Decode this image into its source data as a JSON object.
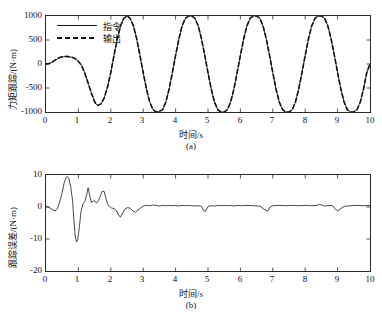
{
  "page": {
    "top_clipped_text": "",
    "bottom_caption_clipped": ""
  },
  "chart_data": [
    {
      "id": "panel-a",
      "type": "line",
      "title": "",
      "sublabel": "(a)",
      "xlabel": "时间/s",
      "ylabel": "力矩跟踪/(N·m)",
      "xlim": [
        0,
        10
      ],
      "ylim": [
        -1000,
        1000
      ],
      "xticks": [
        0,
        1,
        2,
        3,
        4,
        5,
        6,
        7,
        8,
        9,
        10
      ],
      "xticklabels": [
        "0",
        "1",
        "2",
        "3",
        "4",
        "5",
        "6",
        "7",
        "8",
        "9",
        "10"
      ],
      "yticks": [
        -1000,
        -500,
        0,
        500,
        1000
      ],
      "yticklabels": [
        "-1000",
        "-500",
        "0",
        "500",
        "1000"
      ],
      "grid": false,
      "legend_position": "upper-left-inside",
      "series": [
        {
          "name": "指令",
          "style": "solid",
          "color": "#1a1a1a",
          "x": [
            0.0,
            0.1,
            0.2,
            0.3,
            0.4,
            0.5,
            0.6,
            0.7,
            0.8,
            0.9,
            1.0,
            1.1,
            1.2,
            1.3,
            1.4,
            1.5,
            1.55,
            1.6,
            1.7,
            1.8,
            1.9,
            2.0,
            2.1,
            2.2,
            2.3,
            2.4,
            2.5,
            2.6,
            2.7,
            2.8,
            2.9,
            3.0,
            3.1,
            3.2,
            3.3,
            3.4,
            3.5,
            3.6,
            3.7,
            3.8,
            3.9,
            4.0,
            4.1,
            4.2,
            4.3,
            4.4,
            4.5,
            4.6,
            4.7,
            4.8,
            4.9,
            5.0,
            5.1,
            5.2,
            5.3,
            5.4,
            5.5,
            5.6,
            5.7,
            5.8,
            5.9,
            6.0,
            6.1,
            6.2,
            6.3,
            6.4,
            6.5,
            6.6,
            6.7,
            6.8,
            6.9,
            7.0,
            7.1,
            7.2,
            7.3,
            7.4,
            7.5,
            7.6,
            7.7,
            7.8,
            7.9,
            8.0,
            8.1,
            8.2,
            8.3,
            8.4,
            8.5,
            8.6,
            8.7,
            8.8,
            8.9,
            9.0,
            9.1,
            9.2,
            9.3,
            9.4,
            9.5,
            9.6,
            9.7,
            9.8,
            9.9,
            10.0
          ],
          "y": [
            0,
            10,
            40,
            85,
            125,
            148,
            155,
            152,
            140,
            112,
            60,
            -30,
            -190,
            -390,
            -600,
            -780,
            -840,
            -860,
            -830,
            -700,
            -480,
            -180,
            180,
            520,
            790,
            950,
            1000,
            950,
            790,
            520,
            180,
            -180,
            -520,
            -790,
            -950,
            -1000,
            -985,
            -950,
            -790,
            -520,
            -180,
            180,
            520,
            790,
            950,
            1000,
            1000,
            950,
            790,
            520,
            180,
            -180,
            -520,
            -790,
            -950,
            -1000,
            -1000,
            -950,
            -790,
            -520,
            -180,
            180,
            520,
            790,
            950,
            1000,
            1000,
            950,
            790,
            520,
            180,
            -180,
            -520,
            -790,
            -950,
            -1000,
            -1000,
            -950,
            -790,
            -520,
            -180,
            180,
            520,
            790,
            950,
            1000,
            1000,
            950,
            790,
            520,
            180,
            -180,
            -520,
            -790,
            -950,
            -1000,
            -1000,
            -950,
            -790,
            -520,
            -180,
            0
          ]
        },
        {
          "name": "输出",
          "style": "dashed",
          "color": "#111111",
          "x": [
            0.0,
            0.1,
            0.2,
            0.3,
            0.4,
            0.5,
            0.6,
            0.7,
            0.8,
            0.9,
            1.0,
            1.1,
            1.2,
            1.3,
            1.4,
            1.5,
            1.55,
            1.6,
            1.7,
            1.8,
            1.9,
            2.0,
            2.1,
            2.2,
            2.3,
            2.4,
            2.5,
            2.6,
            2.7,
            2.8,
            2.9,
            3.0,
            3.1,
            3.2,
            3.3,
            3.4,
            3.5,
            3.6,
            3.7,
            3.8,
            3.9,
            4.0,
            4.1,
            4.2,
            4.3,
            4.4,
            4.5,
            4.6,
            4.7,
            4.8,
            4.9,
            5.0,
            5.1,
            5.2,
            5.3,
            5.4,
            5.5,
            5.6,
            5.7,
            5.8,
            5.9,
            6.0,
            6.1,
            6.2,
            6.3,
            6.4,
            6.5,
            6.6,
            6.7,
            6.8,
            6.9,
            7.0,
            7.1,
            7.2,
            7.3,
            7.4,
            7.5,
            7.6,
            7.7,
            7.8,
            7.9,
            8.0,
            8.1,
            8.2,
            8.3,
            8.4,
            8.5,
            8.6,
            8.7,
            8.8,
            8.9,
            9.0,
            9.1,
            9.2,
            9.3,
            9.4,
            9.5,
            9.6,
            9.7,
            9.8,
            9.9,
            10.0
          ],
          "y": [
            0,
            12,
            44,
            90,
            130,
            152,
            158,
            154,
            141,
            110,
            56,
            -36,
            -196,
            -396,
            -606,
            -784,
            -844,
            -862,
            -831,
            -698,
            -476,
            -176,
            184,
            524,
            793,
            952,
            1001,
            951,
            791,
            521,
            181,
            -181,
            -521,
            -791,
            -951,
            -1001,
            -986,
            -951,
            -791,
            -521,
            -181,
            181,
            521,
            791,
            951,
            1001,
            1001,
            951,
            791,
            521,
            181,
            -181,
            -521,
            -791,
            -951,
            -1001,
            -1001,
            -951,
            -791,
            -521,
            -181,
            181,
            521,
            791,
            951,
            1001,
            1001,
            951,
            791,
            521,
            181,
            -181,
            -521,
            -791,
            -951,
            -1001,
            -1001,
            -951,
            -791,
            -521,
            -181,
            181,
            521,
            791,
            951,
            1001,
            1001,
            951,
            791,
            521,
            181,
            -181,
            -521,
            -791,
            -951,
            -1001,
            -1001,
            -951,
            -791,
            -521,
            -181,
            2
          ]
        }
      ]
    },
    {
      "id": "panel-b",
      "type": "line",
      "title": "",
      "sublabel": "(b)",
      "xlabel": "时间/s",
      "ylabel": "跟踪误差/(N·m)",
      "xlim": [
        0,
        10
      ],
      "ylim": [
        -20,
        10
      ],
      "xticks": [
        0,
        1,
        2,
        3,
        4,
        5,
        6,
        7,
        8,
        9,
        10
      ],
      "xticklabels": [
        "0",
        "1",
        "2",
        "3",
        "4",
        "5",
        "6",
        "7",
        "8",
        "9",
        "10"
      ],
      "yticks": [
        -20,
        -10,
        0,
        10
      ],
      "yticklabels": [
        "-20",
        "-10",
        "0",
        "10"
      ],
      "grid": false,
      "legend_position": "none",
      "series": [
        {
          "name": "跟踪误差",
          "style": "solid",
          "color": "#1a1a1a",
          "x": [
            0.0,
            0.1,
            0.2,
            0.28,
            0.35,
            0.42,
            0.5,
            0.56,
            0.62,
            0.66,
            0.7,
            0.76,
            0.82,
            0.86,
            0.9,
            0.94,
            0.98,
            1.02,
            1.08,
            1.14,
            1.2,
            1.26,
            1.3,
            1.34,
            1.4,
            1.46,
            1.5,
            1.56,
            1.62,
            1.68,
            1.74,
            1.8,
            1.84,
            1.9,
            1.96,
            2.02,
            2.1,
            2.18,
            2.24,
            2.3,
            2.36,
            2.44,
            2.52,
            2.6,
            2.68,
            2.76,
            2.84,
            2.92,
            3.0,
            3.1,
            3.2,
            3.3,
            3.4,
            3.5,
            3.6,
            3.7,
            3.8,
            3.9,
            4.0,
            4.1,
            4.2,
            4.3,
            4.4,
            4.5,
            4.6,
            4.7,
            4.8,
            4.86,
            4.92,
            5.0,
            5.1,
            5.2,
            5.3,
            5.4,
            5.5,
            5.6,
            5.7,
            5.8,
            5.9,
            6.0,
            6.2,
            6.4,
            6.6,
            6.76,
            6.84,
            6.92,
            7.0,
            7.2,
            7.4,
            7.6,
            7.8,
            8.0,
            8.2,
            8.36,
            8.44,
            8.52,
            8.6,
            8.8,
            8.86,
            8.94,
            9.0,
            9.2,
            9.4,
            9.6,
            9.8,
            10.0
          ],
          "y": [
            0.2,
            -0.2,
            -0.8,
            -1.2,
            -0.6,
            1.5,
            4.5,
            7.5,
            9.2,
            9.5,
            9.0,
            6.5,
            2.0,
            -4.0,
            -9.0,
            -10.9,
            -10.2,
            -7.0,
            -1.5,
            1.0,
            1.8,
            4.0,
            6.0,
            4.0,
            1.5,
            1.8,
            2.0,
            1.2,
            2.0,
            3.5,
            5.0,
            4.8,
            3.0,
            1.0,
            0.2,
            -0.3,
            -0.5,
            -1.2,
            -2.5,
            -3.2,
            -2.0,
            -0.6,
            -0.2,
            -0.4,
            -1.2,
            -1.6,
            -0.9,
            -0.3,
            0.3,
            0.5,
            0.4,
            0.6,
            0.5,
            0.3,
            0.5,
            0.4,
            0.5,
            0.4,
            0.5,
            0.3,
            0.5,
            0.4,
            0.5,
            0.4,
            0.3,
            0.4,
            0.2,
            -1.0,
            -1.4,
            0.2,
            0.4,
            0.3,
            0.5,
            0.4,
            0.5,
            0.4,
            0.5,
            0.3,
            0.5,
            0.4,
            0.5,
            0.4,
            0.3,
            -0.9,
            -1.3,
            0.0,
            0.4,
            0.5,
            0.4,
            0.5,
            0.4,
            0.5,
            0.4,
            0.5,
            0.8,
            0.6,
            0.3,
            0.5,
            0.3,
            -0.8,
            -1.2,
            0.2,
            0.4,
            0.5,
            0.4,
            0.5,
            0.4
          ]
        }
      ]
    }
  ]
}
